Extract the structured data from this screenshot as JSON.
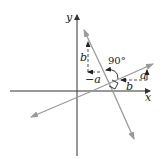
{
  "diagram": {
    "type": "perpendicular-lines-slope",
    "axes": {
      "x_label": "x",
      "y_label": "y"
    },
    "lines": [
      {
        "name": "line-positive-slope",
        "description": "line with rise a over run b",
        "color": "#999999"
      },
      {
        "name": "line-negative-slope",
        "description": "perpendicular line with rise b over run -a",
        "color": "#999999"
      }
    ],
    "labels": {
      "rise_on_positive_line": "a",
      "run_on_positive_line": "b",
      "rise_on_negative_line": "b",
      "run_on_negative_line": "−a",
      "angle": "90°"
    },
    "colors": {
      "axis": "#333333",
      "line": "#9a9a9a",
      "dashed": "#333333",
      "text": "#222222"
    }
  }
}
